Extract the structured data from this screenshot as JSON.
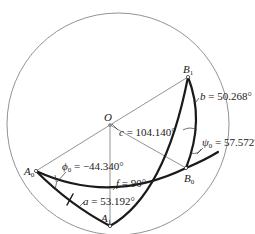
{
  "figure": {
    "points": {
      "O": {
        "name": "O"
      },
      "A0": {
        "name": "A",
        "sub": "0"
      },
      "A1": {
        "name": "A",
        "sub": "1"
      },
      "B0": {
        "name": "B",
        "sub": "0"
      },
      "B1": {
        "name": "B",
        "sub": "1"
      }
    },
    "labels": {
      "b": {
        "sym": "b",
        "text": " = 50.268°"
      },
      "c": {
        "sym": "c",
        "text": " = 104.140°"
      },
      "psi0": {
        "sym": "ψ",
        "sub": "0",
        "text": " = 57.572°"
      },
      "phi0": {
        "sym": "ϕ",
        "sub": "0",
        "text": " = −44.340°"
      },
      "f": {
        "sym": "f",
        "text": " = 90°"
      },
      "a": {
        "sym": "a",
        "text": " = 53.192°"
      }
    }
  }
}
